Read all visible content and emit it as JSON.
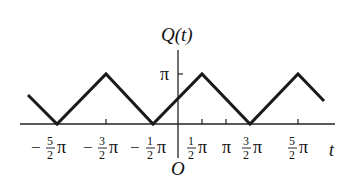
{
  "diagram": {
    "y_axis_label": "Q(t)",
    "x_axis_label": "t",
    "origin_label": "O",
    "y_tick_label": "π",
    "x_ticks": [
      {
        "sign": "−",
        "num": "5",
        "den": "2",
        "pi": "π",
        "value": -2.5
      },
      {
        "sign": "−",
        "num": "3",
        "den": "2",
        "pi": "π",
        "value": -1.5
      },
      {
        "sign": "−",
        "num": "1",
        "den": "2",
        "pi": "π",
        "value": -0.5
      },
      {
        "sign": "",
        "num": "1",
        "den": "2",
        "pi": "π",
        "value": 0.5
      },
      {
        "sign": "",
        "num": "",
        "den": "",
        "pi": "π",
        "value": 1.0
      },
      {
        "sign": "",
        "num": "3",
        "den": "2",
        "pi": "π",
        "value": 1.5
      },
      {
        "sign": "",
        "num": "5",
        "den": "2",
        "pi": "π",
        "value": 2.5
      }
    ],
    "curve": {
      "description": "Triangle wave, period 2π, min 0 at t=-5/2π,-1/2π,3/2π; max π at t=-3/2π,1/2π,5/2π",
      "color": "#1a1a1a"
    }
  }
}
